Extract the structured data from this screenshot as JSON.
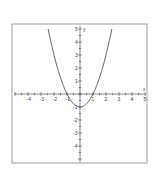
{
  "chart_data": {
    "type": "line",
    "title": "",
    "xlabel": "x",
    "ylabel": "y",
    "xlim": [
      -5,
      5
    ],
    "ylim": [
      -5,
      5
    ],
    "grid": false,
    "x_ticks": [
      -4,
      -3,
      -2,
      -1,
      1,
      2,
      3,
      4,
      5
    ],
    "y_ticks": [
      5,
      4,
      3,
      2,
      1,
      -1,
      -2,
      -3,
      -4
    ],
    "x_tick_labels": [
      "-4",
      "-3",
      "-2",
      "-1",
      "1",
      "2",
      "3",
      "4",
      "5"
    ],
    "y_tick_labels": [
      "5",
      "4",
      "3",
      "2",
      "1",
      "-1",
      "-2",
      "-3",
      "-4"
    ],
    "series": [
      {
        "name": "y = x^2 - 1",
        "x": [
          -2.45,
          -2,
          -1.5,
          -1,
          -0.5,
          0,
          0.5,
          1,
          1.5,
          2,
          2.45
        ],
        "y": [
          5,
          3,
          1.25,
          0,
          -0.75,
          -1,
          -0.75,
          0,
          1.25,
          3,
          5
        ]
      }
    ],
    "colors": {
      "curve": "#555555",
      "axes": "#555555",
      "frame": "#777777"
    }
  }
}
